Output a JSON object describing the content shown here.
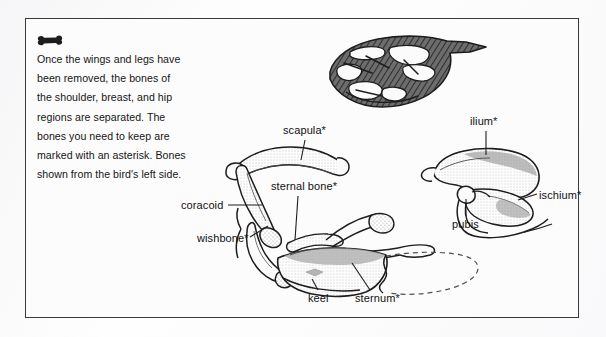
{
  "figure": {
    "background_color": "#fcfcfc",
    "border_color": "#3a3a3a",
    "ink_color": "#1a1a1a"
  },
  "caption": {
    "icon": "bone-icon",
    "lines": [
      "Once the wings and legs have",
      "been removed, the bones of",
      "the shoulder, breast, and hip",
      "regions are separated. The",
      "bones you need to keep are",
      "marked with an asterisk. Bones",
      "shown from the bird's left side."
    ],
    "full_text": "Once the wings and legs have been removed, the bones of the shoulder, breast, and hip regions are separated. The bones you need to keep are marked with an asterisk. Bones shown from the bird's left side."
  },
  "labels": {
    "scapula": "scapula*",
    "sternal_bone": "sternal bone*",
    "coracoid": "coracoid",
    "wishbone": "wishbone*",
    "keel": "keel",
    "sternum": "sternum*",
    "ilium": "ilium*",
    "ischium": "ischium*",
    "pubis": "pubis"
  },
  "illustrations": {
    "bird_silhouette": "hatched bird body outline with skeleton voids",
    "shoulder_breast_group": "scapula, coracoid, wishbone, sternal bone, keel and sternum",
    "pelvis_group": "ilium, ischium and pubis"
  }
}
